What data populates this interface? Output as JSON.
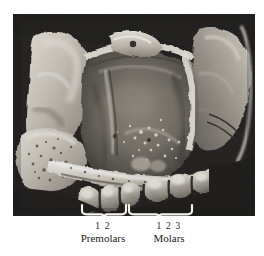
{
  "figure": {
    "type": "anatomical-photograph",
    "palette": {
      "page_background": "#ffffff",
      "plate_background": "#0a0a0a",
      "bone_light": "#e8e4dc",
      "bone_mid": "#9a958c",
      "bone_dark": "#4a4views",
      "annotation_white": "#f5f5f0",
      "caption_text": "#1a1a1a"
    }
  },
  "annotations": {
    "braces": [
      {
        "name": "premolar-brace",
        "x_start": 82,
        "x_end": 126,
        "y": 212
      },
      {
        "name": "molar-brace",
        "x_start": 129,
        "x_end": 192,
        "y": 212
      }
    ]
  },
  "caption": {
    "groups": [
      {
        "id": "premolars",
        "numbers": "1 2",
        "label": "Premolars"
      },
      {
        "id": "molars",
        "numbers": "1 2 3",
        "label": "Molars"
      }
    ]
  }
}
